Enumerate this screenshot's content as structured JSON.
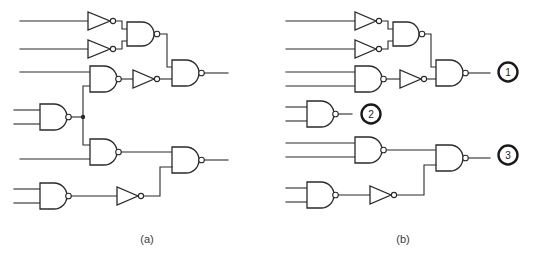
{
  "figure": {
    "width": 535,
    "height": 261,
    "background_color": "#ffffff",
    "line_color": "#2a2a2a"
  },
  "panels": [
    {
      "id": "panel-a",
      "caption": "(a)",
      "caption_x": 147,
      "caption_y": 243,
      "description": "Full combinational logic circuit built from NAND gates and inverters"
    },
    {
      "id": "panel-b",
      "caption": "(b)",
      "caption_x": 403,
      "caption_y": 243,
      "description": "Same circuit partitioned into three numbered sub-circuits"
    }
  ],
  "markers": [
    {
      "label": "1",
      "cx": 508,
      "cy": 72,
      "r": 10
    },
    {
      "label": "2",
      "cx": 371,
      "cy": 114,
      "r": 10
    },
    {
      "label": "3",
      "cx": 508,
      "cy": 155,
      "r": 10
    }
  ],
  "panel_a": {
    "gates": [
      {
        "name": "inverter-a1",
        "type": "inverter",
        "x": 88,
        "y": 21
      },
      {
        "name": "inverter-a2",
        "type": "inverter",
        "x": 88,
        "y": 49
      },
      {
        "name": "nand-a1",
        "type": "nand",
        "x": 127,
        "y": 35
      },
      {
        "name": "nand-a2",
        "type": "nand",
        "x": 90,
        "y": 79
      },
      {
        "name": "inverter-a3",
        "type": "inverter",
        "x": 133,
        "y": 79
      },
      {
        "name": "nand-a3-output",
        "type": "nand",
        "x": 172,
        "y": 73
      },
      {
        "name": "nand-a4",
        "type": "nand",
        "x": 40,
        "y": 117
      },
      {
        "name": "nand-a5",
        "type": "nand",
        "x": 90,
        "y": 152
      },
      {
        "name": "nand-a6-output",
        "type": "nand",
        "x": 172,
        "y": 160
      },
      {
        "name": "nand-a7",
        "type": "nand",
        "x": 40,
        "y": 196
      },
      {
        "name": "inverter-a4",
        "type": "inverter",
        "x": 117,
        "y": 196
      }
    ],
    "junctions": [
      {
        "x": 83,
        "y": 117
      }
    ]
  },
  "panel_b": {
    "gates": [
      {
        "name": "inverter-b1",
        "type": "inverter",
        "x": 355,
        "y": 21
      },
      {
        "name": "inverter-b2",
        "type": "inverter",
        "x": 355,
        "y": 49
      },
      {
        "name": "nand-b1",
        "type": "nand",
        "x": 393,
        "y": 35
      },
      {
        "name": "nand-b2",
        "type": "nand",
        "x": 355,
        "y": 79
      },
      {
        "name": "inverter-b3",
        "type": "inverter",
        "x": 400,
        "y": 79
      },
      {
        "name": "nand-b3-output",
        "type": "nand",
        "x": 436,
        "y": 73
      },
      {
        "name": "nand-b4",
        "type": "nand",
        "x": 307,
        "y": 113
      },
      {
        "name": "nand-b5",
        "type": "nand",
        "x": 355,
        "y": 150
      },
      {
        "name": "nand-b6-output",
        "type": "nand",
        "x": 436,
        "y": 158
      },
      {
        "name": "nand-b7",
        "type": "nand",
        "x": 307,
        "y": 195
      },
      {
        "name": "inverter-b4",
        "type": "inverter",
        "x": 370,
        "y": 195
      }
    ],
    "junctions": []
  }
}
